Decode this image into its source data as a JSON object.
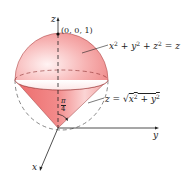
{
  "figure": {
    "point_label": "(0, 0, 1)",
    "sphere_equation": {
      "lhs": "x² + y² + z² = z",
      "parts": [
        "x",
        "2",
        " + y",
        "2",
        " + z",
        "2",
        " = z"
      ]
    },
    "cone_equation": {
      "text": "z = √(x² + y²)",
      "prefix": "z = ",
      "radicand": "x² + y²"
    },
    "angle_label": {
      "numerator": "π",
      "denominator": "4"
    },
    "axes": {
      "x": "x",
      "y": "y",
      "z": "z"
    }
  },
  "colors": {
    "surface": "#f08080",
    "surface_light": "#fde2e2",
    "cone": "#ee6f6f",
    "line": "#333333"
  }
}
